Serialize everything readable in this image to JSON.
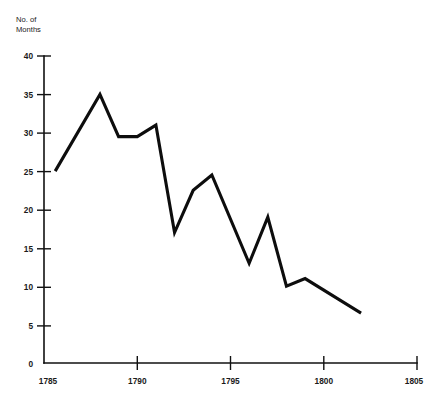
{
  "chart_data": {
    "type": "line",
    "title": "",
    "subtitle": "",
    "xlabel": "",
    "ylabel": "No. of Months",
    "ylabel_lines": [
      "No. of",
      "Months"
    ],
    "xlim": [
      1785,
      1805
    ],
    "ylim": [
      0,
      40
    ],
    "grid": false,
    "legend": null,
    "legend_position": "none",
    "x_ticks": [
      1785,
      1790,
      1795,
      1800,
      1805
    ],
    "x_tick_labels": [
      "1785",
      "1790",
      "1795",
      "1800",
      "1805"
    ],
    "y_ticks": [
      0,
      5,
      10,
      15,
      20,
      25,
      30,
      35,
      40
    ],
    "y_tick_labels": [
      "0",
      "5",
      "10",
      "15",
      "20",
      "25",
      "30",
      "35",
      "40"
    ],
    "line_color": "#0d0d0d",
    "axis_color": "#111111",
    "background_color": "#ffffff",
    "series": [
      {
        "name": "No. of Months",
        "x": [
          1785.6,
          1788.0,
          1789.0,
          1790.0,
          1791.0,
          1792.0,
          1793.0,
          1794.0,
          1796.0,
          1797.0,
          1798.0,
          1799.0,
          1801.0,
          1802.0
        ],
        "values": [
          25.0,
          35.0,
          29.5,
          29.5,
          31.0,
          17.0,
          22.5,
          24.5,
          13.0,
          19.0,
          10.0,
          11.0,
          8.0,
          6.5
        ]
      }
    ],
    "annotations": []
  }
}
